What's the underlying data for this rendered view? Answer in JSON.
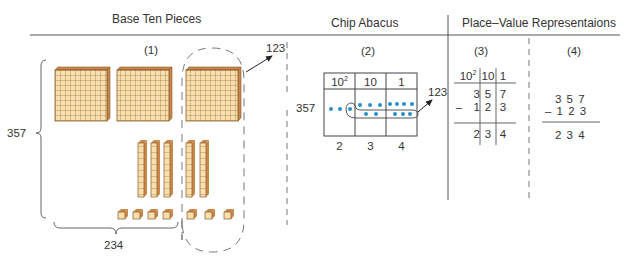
{
  "headers": {
    "base_ten": "Base Ten Pieces",
    "chip_abacus": "Chip Abacus",
    "place_value": "Place–Value Representaions"
  },
  "panels": {
    "p1": "(1)",
    "p2": "(2)",
    "p3": "(3)",
    "p4": "(4)"
  },
  "base_ten": {
    "total": "357",
    "remaining": "234",
    "removed": "123",
    "flats": 3,
    "longs": 5,
    "units": 7
  },
  "abacus": {
    "columns": [
      "10",
      "10",
      "1"
    ],
    "col0_sup": "2",
    "start_value": "357",
    "removed": "123",
    "results": [
      "2",
      "3",
      "4"
    ],
    "chip_color": "#2a8fc8"
  },
  "place_value_table": {
    "headers": [
      "10",
      "10",
      "1"
    ],
    "h0_sup": "2",
    "row1": [
      "3",
      "5",
      "7"
    ],
    "minus": "–",
    "row2": [
      "1",
      "2",
      "3"
    ],
    "result": [
      "2",
      "3",
      "4"
    ]
  },
  "standard": {
    "row1": "3 5 7",
    "row2": "– 1 2 3",
    "result": "2 3 4"
  },
  "colors": {
    "block_fill": "#f7dfae",
    "block_line": "#8a5a2b",
    "block_top": "#c9884a",
    "line": "#555555"
  }
}
